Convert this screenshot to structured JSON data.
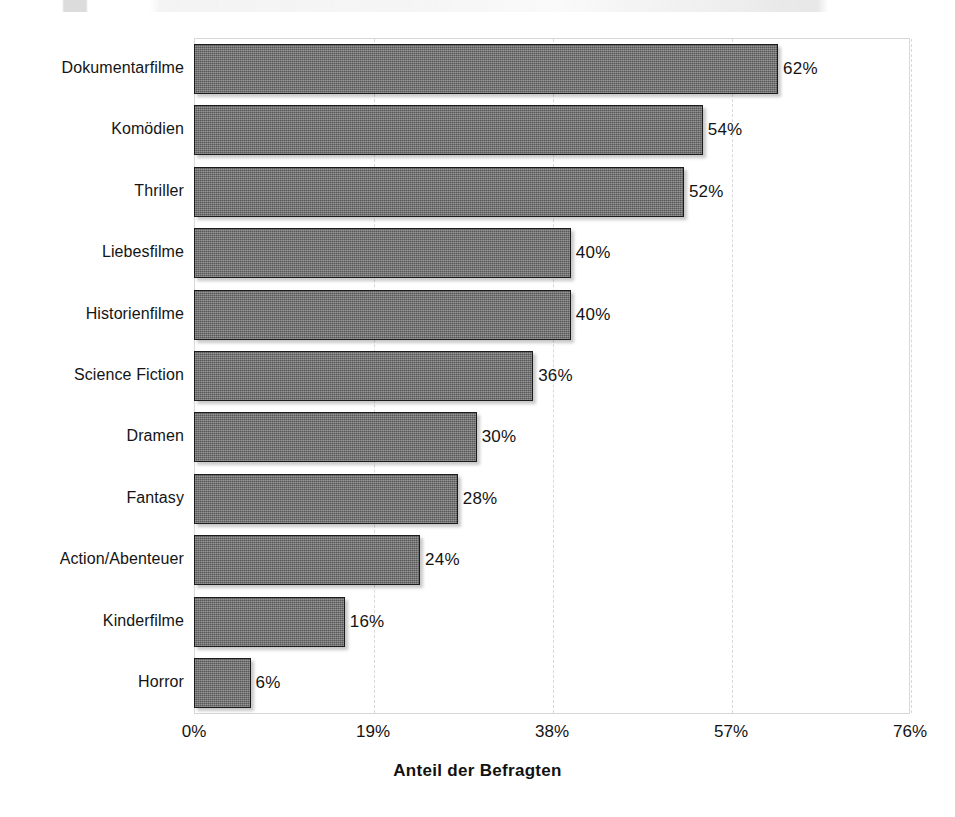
{
  "chart_data": {
    "type": "bar",
    "orientation": "horizontal",
    "title": "",
    "xlabel": "Anteil der Befragten",
    "ylabel": "",
    "categories": [
      "Dokumentarfilme",
      "Komödien",
      "Thriller",
      "Liebesfilme",
      "Historienfilme",
      "Science Fiction",
      "Dramen",
      "Fantasy",
      "Action/Abenteuer",
      "Kinderfilme",
      "Horror"
    ],
    "values": [
      62,
      54,
      52,
      40,
      40,
      36,
      30,
      28,
      24,
      16,
      6
    ],
    "value_labels": [
      "62%",
      "54%",
      "52%",
      "40%",
      "40%",
      "36%",
      "30%",
      "28%",
      "24%",
      "16%",
      "6%"
    ],
    "xlim": [
      0,
      76
    ],
    "xticks": [
      0,
      19,
      38,
      57,
      76
    ],
    "xtick_labels": [
      "0%",
      "19%",
      "38%",
      "57%",
      "76%"
    ],
    "grid": "vertical-dashed",
    "legend": "none",
    "bar_color": "#6d6d6d",
    "bar_border_color": "#1c1c1c",
    "gridline_color": "#d9d9d9",
    "plot_border_color": "#d8d8d8",
    "background_color": "#ffffff",
    "text_color": "#141414"
  }
}
